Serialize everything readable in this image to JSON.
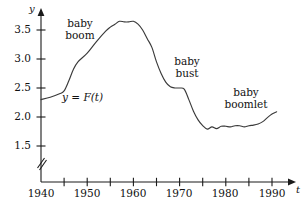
{
  "chart_data": {
    "type": "line",
    "title": "",
    "subtitle": "",
    "xlabel": "t",
    "ylabel": "y",
    "xlim": [
      1940,
      1992
    ],
    "ylim": [
      1.35,
      3.8
    ],
    "grid": false,
    "legend_position": "none",
    "axis_break": {
      "axis": "y",
      "symbol": "//",
      "below_value": 1.5,
      "note": "y-axis broken below 1.5"
    },
    "x_ticks_major": [
      1940,
      1950,
      1960,
      1970,
      1980,
      1990
    ],
    "x_ticklabels": [
      "1940",
      "1950",
      "1960",
      "1970",
      "1980",
      "1990"
    ],
    "x_ticks_minor": [
      1945,
      1955,
      1965,
      1975,
      1985
    ],
    "y_ticks": [
      1.5,
      2.0,
      2.5,
      3.0,
      3.5
    ],
    "y_ticklabels": [
      "1.5",
      "2.0",
      "2.5",
      "3.0",
      "3.5"
    ],
    "series": [
      {
        "name": "y = F(t)",
        "x": [
          1940,
          1942,
          1944,
          1945,
          1946,
          1947,
          1948,
          1950,
          1952,
          1954,
          1955,
          1956,
          1957,
          1958,
          1959,
          1960,
          1961,
          1962,
          1963,
          1964,
          1965,
          1966,
          1967,
          1968,
          1969,
          1970,
          1971,
          1972,
          1973,
          1974,
          1975,
          1976,
          1977,
          1978,
          1979,
          1980,
          1981,
          1982,
          1983,
          1984,
          1985,
          1986,
          1987,
          1988,
          1989,
          1990,
          1991
        ],
        "values": [
          2.3,
          2.34,
          2.4,
          2.45,
          2.62,
          2.82,
          2.95,
          3.1,
          3.3,
          3.48,
          3.55,
          3.6,
          3.65,
          3.64,
          3.64,
          3.65,
          3.6,
          3.5,
          3.35,
          3.2,
          2.95,
          2.75,
          2.6,
          2.52,
          2.5,
          2.5,
          2.48,
          2.3,
          2.1,
          1.95,
          1.85,
          1.79,
          1.83,
          1.8,
          1.84,
          1.84,
          1.83,
          1.85,
          1.85,
          1.83,
          1.85,
          1.86,
          1.88,
          1.92,
          1.99,
          2.05,
          2.09
        ]
      }
    ],
    "annotations": [
      {
        "id": "baby-boom",
        "lines": [
          "baby",
          "boom"
        ],
        "x": 1947,
        "y": 3.52
      },
      {
        "id": "baby-bust",
        "lines": [
          "baby",
          "bust"
        ],
        "x": 1971.5,
        "y": 2.95
      },
      {
        "id": "baby-boomlet",
        "lines": [
          "baby",
          "boomlet"
        ],
        "x": 1982.5,
        "y": 2.38
      },
      {
        "id": "function-label",
        "lines": [
          "y = F(t)"
        ],
        "x": 1951,
        "y": 2.35
      }
    ]
  },
  "axes": {
    "y_axis_name": "y",
    "x_axis_name": "t"
  },
  "labels": {
    "y_ticks": [
      "3.5",
      "3.0",
      "2.5",
      "2.0",
      "1.5"
    ],
    "x_ticks": [
      "1940",
      "1950",
      "1960",
      "1970",
      "1980",
      "1990"
    ],
    "baby_boom_line1": "baby",
    "baby_boom_line2": "boom",
    "baby_bust_line1": "baby",
    "baby_bust_line2": "bust",
    "baby_boomlet_line1": "baby",
    "baby_boomlet_line2": "boomlet",
    "function_label": "y = F(t)"
  },
  "colors": {
    "axis": "#1a1a1a",
    "curve": "#3a3a3a",
    "text": "#111111",
    "background": "#ffffff"
  }
}
